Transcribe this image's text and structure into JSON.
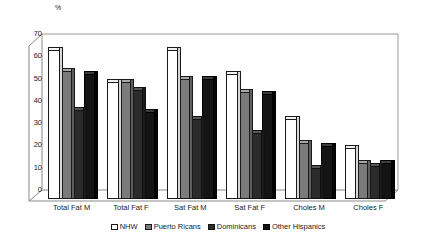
{
  "chart_data": {
    "type": "bar",
    "title": "",
    "subtitle": "",
    "xlabel": "",
    "ylabel": "%",
    "unit_label": "%",
    "ylim": [
      0,
      70
    ],
    "ytick_step": 10,
    "yticks": [
      70,
      60,
      50,
      40,
      30,
      20,
      10,
      0
    ],
    "grid": false,
    "legend_position": "bottom",
    "style": "3d-clustered-column",
    "categories": [
      "Total Fat  M",
      "Total Fat  F",
      "Sat Fat  M",
      "Sat Fat  F",
      "Choles M",
      "Choles F"
    ],
    "series": [
      {
        "name": "NHW",
        "color": "#ffffff",
        "values": [
          67,
          52.5,
          67,
          56,
          36,
          23
        ]
      },
      {
        "name": "Puerto Ricans",
        "color": "#7b7b7b",
        "values": [
          57.5,
          52.5,
          54,
          48,
          25,
          16
        ]
      },
      {
        "name": "Dominicans",
        "color": "#2b2b2b",
        "values": [
          40,
          49,
          36,
          29.5,
          14,
          15
        ]
      },
      {
        "name": "Other Hispanics",
        "color": "#141414",
        "values": [
          56,
          39,
          54,
          47,
          24,
          16
        ]
      }
    ]
  },
  "legend": {
    "items": [
      {
        "label": "NHW"
      },
      {
        "label": "Puerto Ricans"
      },
      {
        "label": "Dominicans"
      },
      {
        "label": "Other Hispanics"
      }
    ]
  }
}
